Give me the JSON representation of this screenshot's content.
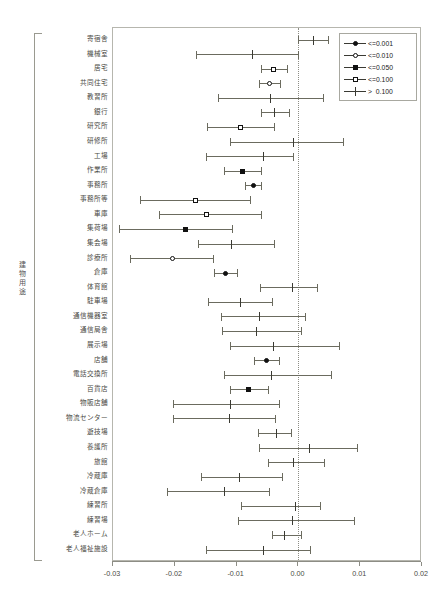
{
  "axis_label_y": "建物用途",
  "xaxis": {
    "ticks": [
      "-0.03",
      "-0.02",
      "-0.01",
      "0.00",
      "0.01",
      "0.02"
    ],
    "tickvalues": [
      -0.03,
      -0.02,
      -0.01,
      0.0,
      0.01,
      0.02
    ],
    "min": -0.03,
    "max": 0.02
  },
  "legend": {
    "entries": [
      {
        "label": "<=0.001",
        "marker": "filled-circle"
      },
      {
        "label": "<=0.010",
        "marker": "open-circle"
      },
      {
        "label": "<=0.050",
        "marker": "filled-square"
      },
      {
        "label": "<=0.100",
        "marker": "open-square"
      },
      {
        "label": ">  0.100",
        "marker": "plus"
      }
    ]
  },
  "chart_data": {
    "type": "scatter",
    "subtype": "forest-plot",
    "title": "",
    "xlabel": "",
    "ylabel": "建物用途",
    "xlim": [
      -0.03,
      0.02
    ],
    "grid": false,
    "reference_line": 0.0,
    "legend_position": "top-right",
    "categories": [
      "寄宿舎",
      "機械室",
      "居宅",
      "共同住宅",
      "教習所",
      "銀行",
      "研究所",
      "研修所",
      "工場",
      "作業所",
      "事務所",
      "事務所等",
      "車庫",
      "集荷場",
      "集会場",
      "診療所",
      "倉庫",
      "体育館",
      "駐車場",
      "通信機器室",
      "通信局舎",
      "展示場",
      "店舗",
      "電話交換所",
      "百貨店",
      "物販店舗",
      "物流センター",
      "遊技場",
      "養護所",
      "旅館",
      "冷蔵庫",
      "冷蔵倉庫",
      "練習所",
      "練習場",
      "老人ホーム",
      "老人福祉施設"
    ],
    "points": [
      {
        "category": "寄宿舎",
        "estimate": 0.0024,
        "low": 0.0,
        "high": 0.0048,
        "significance": ">  0.100",
        "marker": "plus"
      },
      {
        "category": "機械室",
        "estimate": -0.0074,
        "low": -0.0165,
        "high": 0.0,
        "significance": ">  0.100",
        "marker": "plus"
      },
      {
        "category": "居宅",
        "estimate": -0.004,
        "low": -0.0061,
        "high": -0.0019,
        "significance": "<=0.100",
        "marker": "open-square"
      },
      {
        "category": "共同住宅",
        "estimate": -0.0046,
        "low": -0.0064,
        "high": -0.0029,
        "significance": "<=0.010",
        "marker": "open-circle"
      },
      {
        "category": "教習所",
        "estimate": -0.0045,
        "low": -0.013,
        "high": 0.004,
        "significance": ">  0.100",
        "marker": "plus"
      },
      {
        "category": "銀行",
        "estimate": -0.0038,
        "low": -0.0061,
        "high": -0.0015,
        "significance": ">  0.100",
        "marker": "plus"
      },
      {
        "category": "研究所",
        "estimate": -0.0093,
        "low": -0.0148,
        "high": -0.004,
        "significance": "<=0.100",
        "marker": "open-square"
      },
      {
        "category": "研修所",
        "estimate": -0.0008,
        "low": -0.011,
        "high": 0.0072,
        "significance": ">  0.100",
        "marker": "plus"
      },
      {
        "category": "工場",
        "estimate": -0.0056,
        "low": -0.015,
        "high": -0.0008,
        "significance": ">  0.100",
        "marker": "plus"
      },
      {
        "category": "作業所",
        "estimate": -0.0091,
        "low": -0.012,
        "high": -0.0061,
        "significance": "<=0.050",
        "marker": "filled-square"
      },
      {
        "category": "事務所",
        "estimate": -0.0073,
        "low": -0.0086,
        "high": -0.0061,
        "significance": "<=0.001",
        "marker": "filled-circle"
      },
      {
        "category": "事務所等",
        "estimate": -0.0166,
        "low": -0.0257,
        "high": -0.0079,
        "significance": "<=0.100",
        "marker": "open-square"
      },
      {
        "category": "車庫",
        "estimate": -0.0149,
        "low": -0.0225,
        "high": -0.006,
        "significance": "<=0.100",
        "marker": "open-square"
      },
      {
        "category": "集荷場",
        "estimate": -0.0183,
        "low": -0.029,
        "high": -0.0108,
        "significance": "<=0.050",
        "marker": "filled-square"
      },
      {
        "category": "集会場",
        "estimate": -0.0108,
        "low": -0.0163,
        "high": -0.0039,
        "significance": ">  0.100",
        "marker": "plus"
      },
      {
        "category": "診療所",
        "estimate": -0.0203,
        "low": -0.0272,
        "high": -0.0138,
        "significance": "<=0.010",
        "marker": "open-circle"
      },
      {
        "category": "倉庫",
        "estimate": -0.0118,
        "low": -0.0137,
        "high": -0.0099,
        "significance": "<=0.001",
        "marker": "filled-circle"
      },
      {
        "category": "体育館",
        "estimate": -0.001,
        "low": -0.0062,
        "high": 0.003,
        "significance": ">  0.100",
        "marker": "plus"
      },
      {
        "category": "駐車場",
        "estimate": -0.0093,
        "low": -0.0146,
        "high": -0.0042,
        "significance": ">  0.100",
        "marker": "plus"
      },
      {
        "category": "通信機器室",
        "estimate": -0.0063,
        "low": -0.0125,
        "high": 0.0011,
        "significance": ">  0.100",
        "marker": "plus"
      },
      {
        "category": "通信局舎",
        "estimate": -0.0067,
        "low": -0.0123,
        "high": 0.0004,
        "significance": ">  0.100",
        "marker": "plus"
      },
      {
        "category": "展示場",
        "estimate": -0.004,
        "low": -0.011,
        "high": 0.0066,
        "significance": ">  0.100",
        "marker": "plus"
      },
      {
        "category": "店舗",
        "estimate": -0.0051,
        "low": -0.0072,
        "high": -0.0031,
        "significance": "<=0.001",
        "marker": "filled-circle"
      },
      {
        "category": "電話交換所",
        "estimate": -0.0044,
        "low": -0.012,
        "high": 0.0052,
        "significance": ">  0.100",
        "marker": "plus"
      },
      {
        "category": "百貨店",
        "estimate": -0.008,
        "low": -0.0111,
        "high": -0.0049,
        "significance": "<=0.050",
        "marker": "filled-square"
      },
      {
        "category": "物販店舗",
        "estimate": -0.011,
        "low": -0.0203,
        "high": -0.0031,
        "significance": ">  0.100",
        "marker": "plus"
      },
      {
        "category": "物流センター",
        "estimate": -0.0111,
        "low": -0.0203,
        "high": -0.0038,
        "significance": ">  0.100",
        "marker": "plus"
      },
      {
        "category": "遊技場",
        "estimate": -0.0035,
        "low": -0.0065,
        "high": -0.0012,
        "significance": ">  0.100",
        "marker": "plus"
      },
      {
        "category": "養護所",
        "estimate": 0.0018,
        "low": -0.0063,
        "high": 0.0095,
        "significance": ">  0.100",
        "marker": "plus"
      },
      {
        "category": "旅館",
        "estimate": -0.0008,
        "low": -0.005,
        "high": 0.0042,
        "significance": ">  0.100",
        "marker": "plus"
      },
      {
        "category": "冷蔵庫",
        "estimate": -0.0095,
        "low": -0.0158,
        "high": -0.0027,
        "significance": ">  0.100",
        "marker": "plus"
      },
      {
        "category": "冷蔵倉庫",
        "estimate": -0.012,
        "low": -0.0212,
        "high": -0.0047,
        "significance": ">  0.100",
        "marker": "plus"
      },
      {
        "category": "練習所",
        "estimate": -0.0005,
        "low": -0.0093,
        "high": 0.0035,
        "significance": ">  0.100",
        "marker": "plus"
      },
      {
        "category": "練習場",
        "estimate": -0.001,
        "low": -0.0098,
        "high": 0.009,
        "significance": ">  0.100",
        "marker": "plus"
      },
      {
        "category": "老人ホーム",
        "estimate": -0.0023,
        "low": -0.0042,
        "high": 0.0004,
        "significance": ">  0.100",
        "marker": "plus"
      },
      {
        "category": "老人福祉施設",
        "estimate": -0.0056,
        "low": -0.015,
        "high": 0.0018,
        "significance": ">  0.100",
        "marker": "plus"
      }
    ]
  }
}
